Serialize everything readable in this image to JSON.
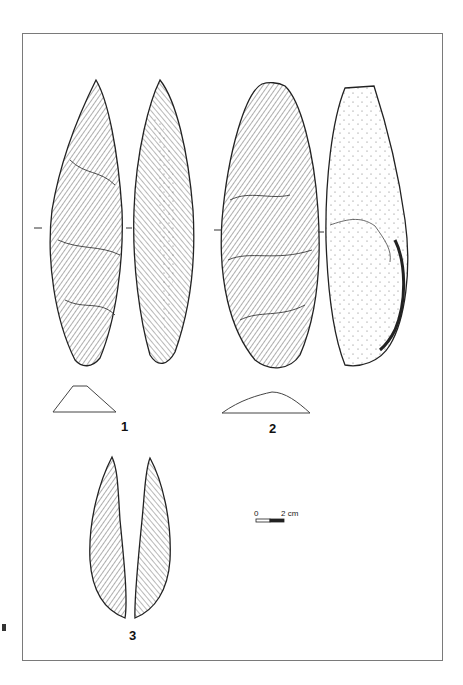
{
  "plate": {
    "description": "Archaeological illustration plate of flaked stone tools (lithic artifacts)",
    "frame_color": "#7a7a7a"
  },
  "figures": [
    {
      "id": "1",
      "label": "1",
      "views": [
        "dorsal face",
        "ventral face"
      ],
      "section": "trapezoidal cross-section"
    },
    {
      "id": "2",
      "label": "2",
      "views": [
        "dorsal face",
        "ventral face (cortex, stippled)"
      ],
      "section": "plano-convex cross-section"
    },
    {
      "id": "3",
      "label": "3",
      "views": [
        "face A",
        "face B"
      ],
      "section": ""
    }
  ],
  "scale_bar": {
    "start_label": "0",
    "end_label": "2 cm"
  }
}
